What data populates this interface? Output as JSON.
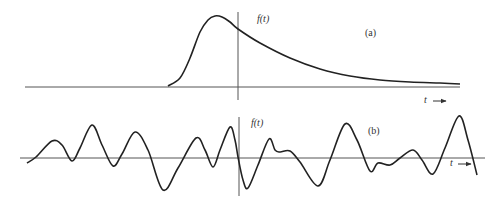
{
  "chart_data": [
    {
      "type": "line",
      "panel": "(a)",
      "title": "(a)",
      "ylabel": "f(t)",
      "xlabel": "t →",
      "description": "Single pulse: sharp rise before t=0, peak slightly left of vertical axis, long exponential-like decay to the right",
      "grid": false,
      "points_px": [
        [
          168,
          86
        ],
        [
          180,
          78
        ],
        [
          190,
          58
        ],
        [
          200,
          32
        ],
        [
          208,
          20
        ],
        [
          215,
          16
        ],
        [
          222,
          17
        ],
        [
          230,
          22
        ],
        [
          238,
          29
        ],
        [
          260,
          43
        ],
        [
          290,
          58
        ],
        [
          320,
          69
        ],
        [
          350,
          76
        ],
        [
          380,
          80
        ],
        [
          410,
          82
        ],
        [
          440,
          83
        ],
        [
          460,
          84
        ]
      ],
      "axes_px": {
        "x_axis_y": 87,
        "x_from": 25,
        "x_to": 460,
        "y_axis_x": 238,
        "y_from": 12,
        "y_to": 100
      }
    },
    {
      "type": "line",
      "panel": "(b)",
      "title": "(b)",
      "ylabel": "f(t)",
      "xlabel": "t →",
      "description": "Irregular random oscillating signal about the horizontal axis",
      "grid": false,
      "points_px": [
        [
          27,
          163
        ],
        [
          36,
          157
        ],
        [
          52,
          141
        ],
        [
          62,
          145
        ],
        [
          72,
          161
        ],
        [
          80,
          148
        ],
        [
          92,
          125
        ],
        [
          102,
          145
        ],
        [
          113,
          166
        ],
        [
          122,
          154
        ],
        [
          135,
          132
        ],
        [
          148,
          150
        ],
        [
          163,
          190
        ],
        [
          178,
          168
        ],
        [
          196,
          138
        ],
        [
          205,
          150
        ],
        [
          213,
          167
        ],
        [
          220,
          150
        ],
        [
          230,
          127
        ],
        [
          235,
          140
        ],
        [
          238,
          157
        ],
        [
          243,
          180
        ],
        [
          248,
          188
        ],
        [
          258,
          165
        ],
        [
          269,
          139
        ],
        [
          275,
          150
        ],
        [
          280,
          152
        ],
        [
          290,
          151
        ],
        [
          300,
          162
        ],
        [
          318,
          186
        ],
        [
          330,
          160
        ],
        [
          345,
          124
        ],
        [
          357,
          140
        ],
        [
          370,
          171
        ],
        [
          378,
          163
        ],
        [
          390,
          165
        ],
        [
          400,
          158
        ],
        [
          413,
          150
        ],
        [
          422,
          160
        ],
        [
          433,
          174
        ],
        [
          445,
          148
        ],
        [
          459,
          116
        ],
        [
          468,
          140
        ],
        [
          477,
          175
        ]
      ],
      "axes_px": {
        "x_axis_y": 158,
        "x_from": 20,
        "x_to": 485,
        "y_axis_x": 239,
        "y_from": 117,
        "y_to": 196
      }
    }
  ],
  "labels": {
    "a": {
      "func": "f(t)",
      "panel": "(a)",
      "axis": "t"
    },
    "b": {
      "func": "f(t)",
      "panel": "(b)",
      "axis": "t"
    }
  },
  "colors": {
    "curve": "#222222",
    "axis": "#555555",
    "text": "#333333"
  }
}
